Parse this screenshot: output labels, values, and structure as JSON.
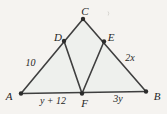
{
  "diagram": {
    "type": "geometry-triangle-figure",
    "vertex_labels": {
      "A": "A",
      "B": "B",
      "C": "C",
      "D": "D",
      "E": "E",
      "F": "F"
    },
    "measure_labels": {
      "AD": "10",
      "EB": "2x",
      "AF": "y + 12",
      "FB": "3y"
    },
    "colors": {
      "background": "#f5f3f0",
      "triangle_fill": "#eef0ed",
      "line": "#3f3f3f",
      "dot": "#2b2b2b",
      "text": "#262626",
      "artifact": "#d8d6d2"
    }
  }
}
